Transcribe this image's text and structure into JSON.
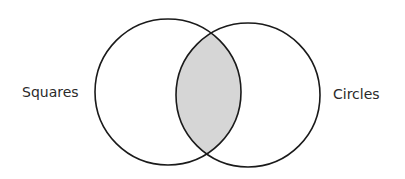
{
  "diagram": {
    "type": "venn",
    "sets": [
      {
        "label": "Squares",
        "cx": 168,
        "cy": 92,
        "r": 73
      },
      {
        "label": "Circles",
        "cx": 248,
        "cy": 95,
        "r": 72
      }
    ],
    "intersection": {
      "shaded": true,
      "fill": "#d6d6d6"
    },
    "stroke": "#1a1a1a"
  }
}
